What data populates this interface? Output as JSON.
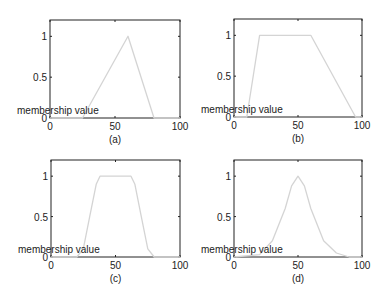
{
  "figure": {
    "panels": [
      {
        "caption": "(a)",
        "ylabel": "membership value",
        "xticks": [
          "0",
          "50",
          "100"
        ],
        "yticks": [
          "0",
          "0.5",
          "1"
        ]
      },
      {
        "caption": "(b)",
        "ylabel": "membership value",
        "xticks": [
          "0",
          "50",
          "100"
        ],
        "yticks": [
          "0",
          "0.5",
          "1"
        ]
      },
      {
        "caption": "(c)",
        "ylabel": "membership value",
        "xticks": [
          "0",
          "50",
          "100"
        ],
        "yticks": [
          "0",
          "0.5",
          "1"
        ]
      },
      {
        "caption": "(d)",
        "ylabel": "membership value",
        "xticks": [
          "0",
          "50",
          "100"
        ],
        "yticks": [
          "0",
          "0.5",
          "1"
        ]
      }
    ],
    "colors": {
      "curve": "#d4d4d4",
      "axes": "#222222"
    }
  },
  "chart_data": [
    {
      "type": "line",
      "title": "(a)",
      "xlabel": "",
      "ylabel": "membership value",
      "xlim": [
        0,
        100
      ],
      "ylim": [
        0,
        1.2
      ],
      "grid": false,
      "series": [
        {
          "name": "triangular",
          "x": [
            0,
            25,
            60,
            80,
            100
          ],
          "y": [
            0,
            0,
            1,
            0,
            0
          ]
        }
      ]
    },
    {
      "type": "line",
      "title": "(b)",
      "xlabel": "",
      "ylabel": "membership value",
      "xlim": [
        0,
        100
      ],
      "ylim": [
        0,
        1.2
      ],
      "grid": false,
      "series": [
        {
          "name": "trapezoidal",
          "x": [
            0,
            10,
            20,
            60,
            95,
            100
          ],
          "y": [
            0,
            0,
            1,
            1,
            0,
            0
          ]
        }
      ]
    },
    {
      "type": "line",
      "title": "(c)",
      "xlabel": "",
      "ylabel": "membership value",
      "xlim": [
        0,
        100
      ],
      "ylim": [
        0,
        1.2
      ],
      "grid": false,
      "series": [
        {
          "name": "smooth trapezoidal",
          "x": [
            0,
            20,
            25,
            30,
            35,
            38,
            62,
            65,
            70,
            75,
            80,
            100
          ],
          "y": [
            0,
            0,
            0.1,
            0.5,
            0.9,
            1,
            1,
            0.9,
            0.5,
            0.1,
            0,
            0
          ]
        }
      ]
    },
    {
      "type": "line",
      "title": "(d)",
      "xlabel": "",
      "ylabel": "membership value",
      "xlim": [
        0,
        100
      ],
      "ylim": [
        0,
        1.2
      ],
      "grid": false,
      "series": [
        {
          "name": "gaussian",
          "x": [
            0,
            20,
            30,
            40,
            45,
            50,
            55,
            60,
            70,
            80,
            90,
            100
          ],
          "y": [
            0,
            0.03,
            0.2,
            0.6,
            0.88,
            1,
            0.88,
            0.6,
            0.2,
            0.05,
            0,
            0
          ]
        }
      ]
    }
  ]
}
